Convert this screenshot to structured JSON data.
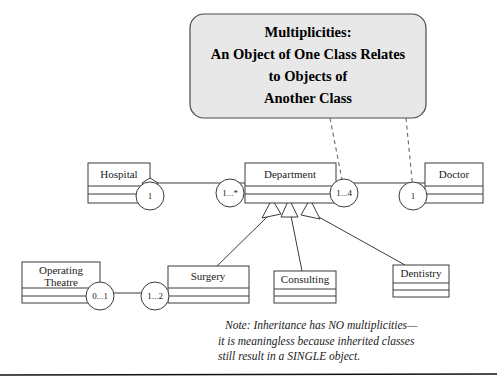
{
  "diagram": {
    "title_callout": {
      "lines": [
        "Multiplicities:",
        "An Object of One Class Relates",
        "to Objects of",
        "Another Class"
      ],
      "fill_color": "#e8e8e8",
      "border_color": "#4a4a4a"
    },
    "classes": [
      {
        "id": "hospital",
        "name": "Hospital",
        "name_lines": [
          "Hospital"
        ]
      },
      {
        "id": "department",
        "name": "Department",
        "name_lines": [
          "Department"
        ]
      },
      {
        "id": "doctor",
        "name": "Doctor",
        "name_lines": [
          "Doctor"
        ]
      },
      {
        "id": "operating-theatre",
        "name": "Operating Theatre",
        "name_lines": [
          "Operating",
          "Theatre"
        ]
      },
      {
        "id": "surgery",
        "name": "Surgery",
        "name_lines": [
          "Surgery"
        ]
      },
      {
        "id": "consulting",
        "name": "Consulting",
        "name_lines": [
          "Consulting"
        ]
      },
      {
        "id": "dentistry",
        "name": "Dentistry",
        "name_lines": [
          "Dentistry"
        ]
      }
    ],
    "multiplicities": [
      {
        "id": "hospital-end",
        "label": "1",
        "near_class": "Hospital"
      },
      {
        "id": "department-left-end",
        "label": "1...*",
        "near_class": "Department"
      },
      {
        "id": "department-right-end",
        "label": "1...4",
        "near_class": "Department"
      },
      {
        "id": "doctor-end",
        "label": "1",
        "near_class": "Doctor"
      },
      {
        "id": "operating-theatre-end",
        "label": "0...1",
        "near_class": "Operating Theatre"
      },
      {
        "id": "surgery-end",
        "label": "1...2",
        "near_class": "Surgery"
      }
    ],
    "note": {
      "lines": [
        "Note: Inheritance has NO multiplicities—",
        "it is meaningless because inherited classes",
        "still result in a SINGLE object."
      ]
    }
  }
}
